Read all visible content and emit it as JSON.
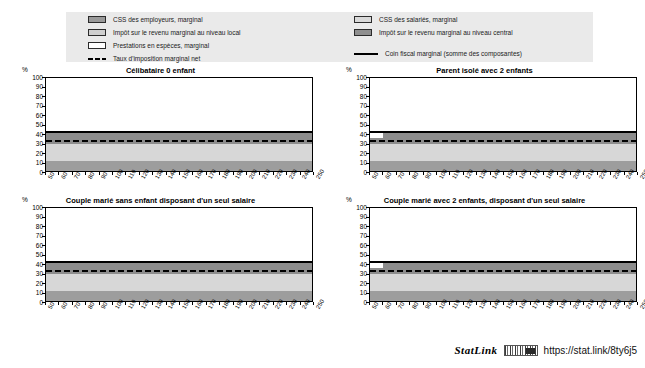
{
  "legend": {
    "left_items": [
      {
        "label": "CSS des employeurs, marginal",
        "swatch": "employer-swatch",
        "color": "#9a9a9a"
      },
      {
        "label": "Impôt sur le revenu marginal au niveau local",
        "swatch": "local-tax-swatch",
        "color": "#cfcfcf"
      },
      {
        "label": "Prestations en espèces, marginal",
        "swatch": "benefits-swatch",
        "color": "#ffffff"
      },
      {
        "label": "Taux d'imposition marginal net",
        "swatch": "dashed-line-marker",
        "color": "#000000"
      }
    ],
    "right_items": [
      {
        "label": "CSS des salariés, marginal",
        "swatch": "employee-swatch",
        "color": "#d9d9d9"
      },
      {
        "label": "Impôt sur le revenu marginal au niveau central",
        "swatch": "central-tax-swatch",
        "color": "#8f8f8f"
      },
      {
        "label": "Coin fiscal marginal (somme des composantes)",
        "swatch": "solid-line-marker",
        "color": "#000000"
      }
    ]
  },
  "axis": {
    "unit": "%",
    "y_ticks": [
      "100",
      "90",
      "80",
      "70",
      "60",
      "50",
      "40",
      "30",
      "20",
      "10",
      "0"
    ],
    "x_ticks": [
      "50",
      "60",
      "70",
      "80",
      "90",
      "100",
      "110",
      "120",
      "130",
      "140",
      "150",
      "160",
      "170",
      "180",
      "190",
      "200",
      "210",
      "220",
      "230",
      "240",
      "250"
    ]
  },
  "footer": {
    "statlink_word": "StatLink",
    "glyph": "barcode-icon",
    "url": "https://stat.link/8ty6j5"
  },
  "chart_data": [
    {
      "type": "area",
      "id": "panel-celibataire",
      "title": "Célibataire 0 enfant",
      "xlabel": "",
      "ylabel": "%",
      "xlim": [
        50,
        250
      ],
      "ylim": [
        0,
        100
      ],
      "grid": false,
      "x": [
        50,
        60,
        70,
        80,
        90,
        100,
        110,
        120,
        130,
        140,
        150,
        160,
        170,
        180,
        190,
        200,
        210,
        220,
        230,
        240,
        250
      ],
      "series": [
        {
          "name": "CSS des employeurs, marginal",
          "color": "#9d9d9d",
          "band": [
            0,
            13
          ],
          "values": [
            13,
            13,
            13,
            13,
            13,
            13,
            13,
            13,
            13,
            13,
            13,
            13,
            13,
            13,
            13,
            13,
            13,
            13,
            13,
            13,
            13
          ]
        },
        {
          "name": "CSS des salariés, marginal",
          "color": "#d7d7d7",
          "band": [
            13,
            31
          ],
          "values": [
            18,
            18,
            18,
            18,
            18,
            18,
            18,
            18,
            18,
            18,
            18,
            18,
            18,
            18,
            18,
            18,
            18,
            18,
            18,
            18,
            18
          ]
        },
        {
          "name": "Impôt sur le revenu marginal au niveau central",
          "color": "#8d8d8d",
          "band": [
            31,
            43
          ],
          "values": [
            12,
            12,
            12,
            12,
            12,
            12,
            12,
            12,
            12,
            12,
            12,
            12,
            12,
            12,
            12,
            12,
            12,
            12,
            12,
            12,
            12
          ]
        },
        {
          "name": "Impôt sur le revenu marginal au niveau local",
          "color": "#cfcfcf",
          "band": [
            0,
            0
          ],
          "values": [
            0,
            0,
            0,
            0,
            0,
            0,
            0,
            0,
            0,
            0,
            0,
            0,
            0,
            0,
            0,
            0,
            0,
            0,
            0,
            0,
            0
          ]
        },
        {
          "name": "Prestations en espèces, marginal",
          "color": "#ffffff",
          "band": [
            0,
            0
          ],
          "values": [
            0,
            0,
            0,
            0,
            0,
            0,
            0,
            0,
            0,
            0,
            0,
            0,
            0,
            0,
            0,
            0,
            0,
            0,
            0,
            0,
            0
          ]
        }
      ],
      "lines": [
        {
          "name": "Coin fiscal marginal (somme des composantes)",
          "style": "solid",
          "color": "#000000",
          "values": [
            43,
            43,
            43,
            43,
            43,
            43,
            43,
            43,
            43,
            43,
            43,
            43,
            43,
            43,
            43,
            43,
            43,
            43,
            43,
            43,
            43
          ]
        },
        {
          "name": "Taux d'imposition marginal net",
          "style": "dashed",
          "color": "#000000",
          "values": [
            33.5,
            33.5,
            33.5,
            33.5,
            33.5,
            33.5,
            33.5,
            33.5,
            33.5,
            33.5,
            33.5,
            33.5,
            33.5,
            33.5,
            33.5,
            33.5,
            33.5,
            33.5,
            33.5,
            33.5,
            33.5
          ]
        }
      ]
    },
    {
      "type": "area",
      "id": "panel-parent-isole",
      "title": "Parent isolé avec 2 enfants",
      "xlabel": "",
      "ylabel": "%",
      "xlim": [
        50,
        250
      ],
      "ylim": [
        0,
        100
      ],
      "grid": false,
      "x": [
        50,
        60,
        70,
        80,
        90,
        100,
        110,
        120,
        130,
        140,
        150,
        160,
        170,
        180,
        190,
        200,
        210,
        220,
        230,
        240,
        250
      ],
      "series": [
        {
          "name": "CSS des employeurs, marginal",
          "color": "#9d9d9d",
          "band": [
            0,
            13
          ],
          "values": [
            13,
            13,
            13,
            13,
            13,
            13,
            13,
            13,
            13,
            13,
            13,
            13,
            13,
            13,
            13,
            13,
            13,
            13,
            13,
            13,
            13
          ]
        },
        {
          "name": "CSS des salariés, marginal",
          "color": "#d7d7d7",
          "band": [
            13,
            31
          ],
          "values": [
            18,
            18,
            18,
            18,
            18,
            18,
            18,
            18,
            18,
            18,
            18,
            18,
            18,
            18,
            18,
            18,
            18,
            18,
            18,
            18,
            18
          ]
        },
        {
          "name": "Impôt sur le revenu marginal au niveau central",
          "color": "#8d8d8d",
          "band": [
            31,
            43
          ],
          "values": [
            6,
            12,
            12,
            12,
            12,
            12,
            12,
            12,
            12,
            12,
            12,
            12,
            12,
            12,
            12,
            12,
            12,
            12,
            12,
            12,
            12
          ]
        },
        {
          "name": "Impôt sur le revenu marginal au niveau local",
          "color": "#cfcfcf",
          "band": [
            0,
            0
          ],
          "values": [
            0,
            0,
            0,
            0,
            0,
            0,
            0,
            0,
            0,
            0,
            0,
            0,
            0,
            0,
            0,
            0,
            0,
            0,
            0,
            0,
            0
          ]
        },
        {
          "name": "Prestations en espèces, marginal",
          "color": "#ffffff",
          "band": [
            0,
            0
          ],
          "values": [
            0,
            0,
            0,
            0,
            0,
            0,
            0,
            0,
            0,
            0,
            0,
            0,
            0,
            0,
            0,
            0,
            0,
            0,
            0,
            0,
            0
          ]
        }
      ],
      "lines": [
        {
          "name": "Coin fiscal marginal (somme des composantes)",
          "style": "solid",
          "color": "#000000",
          "values": [
            43,
            43,
            43,
            43,
            43,
            43,
            43,
            43,
            43,
            43,
            43,
            43,
            43,
            43,
            43,
            43,
            43,
            43,
            43,
            43,
            43
          ]
        },
        {
          "name": "Taux d'imposition marginal net",
          "style": "dashed",
          "color": "#000000",
          "values": [
            33.5,
            33.5,
            33.5,
            33.5,
            33.5,
            33.5,
            33.5,
            33.5,
            33.5,
            33.5,
            33.5,
            33.5,
            33.5,
            33.5,
            33.5,
            33.5,
            33.5,
            33.5,
            33.5,
            33.5,
            33.5
          ]
        }
      ]
    },
    {
      "type": "area",
      "id": "panel-couple-sans-enfant",
      "title": "Couple marié sans enfant disposant d'un seul salaire",
      "xlabel": "",
      "ylabel": "%",
      "xlim": [
        50,
        250
      ],
      "ylim": [
        0,
        100
      ],
      "grid": false,
      "x": [
        50,
        60,
        70,
        80,
        90,
        100,
        110,
        120,
        130,
        140,
        150,
        160,
        170,
        180,
        190,
        200,
        210,
        220,
        230,
        240,
        250
      ],
      "series": [
        {
          "name": "CSS des employeurs, marginal",
          "color": "#9d9d9d",
          "band": [
            0,
            13
          ],
          "values": [
            13,
            13,
            13,
            13,
            13,
            13,
            13,
            13,
            13,
            13,
            13,
            13,
            13,
            13,
            13,
            13,
            13,
            13,
            13,
            13,
            13
          ]
        },
        {
          "name": "CSS des salariés, marginal",
          "color": "#d7d7d7",
          "band": [
            13,
            31
          ],
          "values": [
            18,
            18,
            18,
            18,
            18,
            18,
            18,
            18,
            18,
            18,
            18,
            18,
            18,
            18,
            18,
            18,
            18,
            18,
            18,
            18,
            18
          ]
        },
        {
          "name": "Impôt sur le revenu marginal au niveau central",
          "color": "#8d8d8d",
          "band": [
            31,
            43
          ],
          "values": [
            12,
            12,
            12,
            12,
            12,
            12,
            12,
            12,
            12,
            12,
            12,
            12,
            12,
            12,
            12,
            12,
            12,
            12,
            12,
            12,
            12
          ]
        },
        {
          "name": "Impôt sur le revenu marginal au niveau local",
          "color": "#cfcfcf",
          "band": [
            0,
            0
          ],
          "values": [
            0,
            0,
            0,
            0,
            0,
            0,
            0,
            0,
            0,
            0,
            0,
            0,
            0,
            0,
            0,
            0,
            0,
            0,
            0,
            0,
            0
          ]
        },
        {
          "name": "Prestations en espèces, marginal",
          "color": "#ffffff",
          "band": [
            0,
            0
          ],
          "values": [
            0,
            0,
            0,
            0,
            0,
            0,
            0,
            0,
            0,
            0,
            0,
            0,
            0,
            0,
            0,
            0,
            0,
            0,
            0,
            0,
            0
          ]
        }
      ],
      "lines": [
        {
          "name": "Coin fiscal marginal (somme des composantes)",
          "style": "solid",
          "color": "#000000",
          "values": [
            43,
            43,
            43,
            43,
            43,
            43,
            43,
            43,
            43,
            43,
            43,
            43,
            43,
            43,
            43,
            43,
            43,
            43,
            43,
            43,
            43
          ]
        },
        {
          "name": "Taux d'imposition marginal net",
          "style": "dashed",
          "color": "#000000",
          "values": [
            33.5,
            33.5,
            33.5,
            33.5,
            33.5,
            33.5,
            33.5,
            33.5,
            33.5,
            33.5,
            33.5,
            33.5,
            33.5,
            33.5,
            33.5,
            33.5,
            33.5,
            33.5,
            33.5,
            33.5,
            33.5
          ]
        }
      ]
    },
    {
      "type": "area",
      "id": "panel-couple-2-enfants",
      "title": "Couple marié avec 2 enfants, disposant d'un seul salaire",
      "xlabel": "",
      "ylabel": "%",
      "xlim": [
        50,
        250
      ],
      "ylim": [
        0,
        100
      ],
      "grid": false,
      "x": [
        50,
        60,
        70,
        80,
        90,
        100,
        110,
        120,
        130,
        140,
        150,
        160,
        170,
        180,
        190,
        200,
        210,
        220,
        230,
        240,
        250
      ],
      "series": [
        {
          "name": "CSS des employeurs, marginal",
          "color": "#9d9d9d",
          "band": [
            0,
            13
          ],
          "values": [
            13,
            13,
            13,
            13,
            13,
            13,
            13,
            13,
            13,
            13,
            13,
            13,
            13,
            13,
            13,
            13,
            13,
            13,
            13,
            13,
            13
          ]
        },
        {
          "name": "CSS des salariés, marginal",
          "color": "#d7d7d7",
          "band": [
            13,
            31
          ],
          "values": [
            18,
            18,
            18,
            18,
            18,
            18,
            18,
            18,
            18,
            18,
            18,
            18,
            18,
            18,
            18,
            18,
            18,
            18,
            18,
            18,
            18
          ]
        },
        {
          "name": "Impôt sur le revenu marginal au niveau central",
          "color": "#8d8d8d",
          "band": [
            31,
            43
          ],
          "values": [
            6,
            12,
            12,
            12,
            12,
            12,
            12,
            12,
            12,
            12,
            12,
            12,
            12,
            12,
            12,
            12,
            12,
            12,
            12,
            12,
            12
          ]
        },
        {
          "name": "Impôt sur le revenu marginal au niveau local",
          "color": "#cfcfcf",
          "band": [
            0,
            0
          ],
          "values": [
            0,
            0,
            0,
            0,
            0,
            0,
            0,
            0,
            0,
            0,
            0,
            0,
            0,
            0,
            0,
            0,
            0,
            0,
            0,
            0,
            0
          ]
        },
        {
          "name": "Prestations en espèces, marginal",
          "color": "#ffffff",
          "band": [
            0,
            0
          ],
          "values": [
            0,
            0,
            0,
            0,
            0,
            0,
            0,
            0,
            0,
            0,
            0,
            0,
            0,
            0,
            0,
            0,
            0,
            0,
            0,
            0,
            0
          ]
        }
      ],
      "lines": [
        {
          "name": "Coin fiscal marginal (somme des composantes)",
          "style": "solid",
          "color": "#000000",
          "values": [
            43,
            43,
            43,
            43,
            43,
            43,
            43,
            43,
            43,
            43,
            43,
            43,
            43,
            43,
            43,
            43,
            43,
            43,
            43,
            43,
            43
          ]
        },
        {
          "name": "Taux d'imposition marginal net",
          "style": "dashed",
          "color": "#000000",
          "values": [
            33.5,
            33.5,
            33.5,
            33.5,
            33.5,
            33.5,
            33.5,
            33.5,
            33.5,
            33.5,
            33.5,
            33.5,
            33.5,
            33.5,
            33.5,
            33.5,
            33.5,
            33.5,
            33.5,
            33.5,
            33.5
          ]
        }
      ]
    }
  ]
}
